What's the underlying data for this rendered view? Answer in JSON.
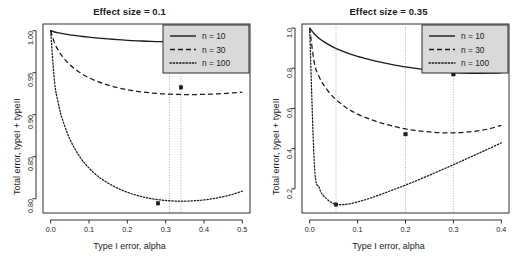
{
  "figure": {
    "width": 518,
    "height": 259,
    "background": "#ffffff",
    "line_color": "#1a1a1a",
    "legend_fill": "#d9d9d9",
    "guide_color": "#9a9a9a"
  },
  "panels": [
    {
      "id": "left",
      "title": "Effect size = 0.1",
      "xlabel": "Type I error, alpha",
      "ylabel": "Total error, typeI + typeII",
      "xticks": [
        "0.0",
        "0.1",
        "0.2",
        "0.3",
        "0.4",
        "0.5"
      ],
      "xtick_values": [
        0.0,
        0.1,
        0.2,
        0.3,
        0.4,
        0.5
      ],
      "yticks": [
        "1.00",
        "0.95",
        "0.90",
        "0.85",
        "0.80"
      ],
      "ytick_values": [
        1.0,
        0.95,
        0.9,
        0.85,
        0.8
      ],
      "xlim": [
        -0.02,
        0.52
      ],
      "ylim": [
        0.783,
        1.008
      ],
      "legend": {
        "position": "top-right",
        "entries": [
          {
            "label": "n = 10",
            "style": "solid"
          },
          {
            "label": "n = 30",
            "style": "dashed"
          },
          {
            "label": "n = 100",
            "style": "dotted"
          }
        ]
      },
      "minimum_markers": [
        {
          "series": "n = 30",
          "x": 0.34,
          "y": 0.9325
        },
        {
          "series": "n = 100",
          "x": 0.28,
          "y": 0.7945
        }
      ],
      "guide_lines_x": [
        0.31,
        0.34
      ]
    },
    {
      "id": "right",
      "title": "Effect size = 0.35",
      "xlabel": "Type I error, alpha",
      "ylabel": "Total error, typeI + typeII",
      "xticks": [
        "0.0",
        "0.1",
        "0.2",
        "0.3",
        "0.4"
      ],
      "xtick_values": [
        0.0,
        0.1,
        0.2,
        0.3,
        0.4
      ],
      "yticks": [
        "1.0",
        "0.8",
        "0.6",
        "0.4",
        "0.2"
      ],
      "ytick_values": [
        1.0,
        0.8,
        0.6,
        0.4,
        0.2
      ],
      "xlim": [
        -0.016,
        0.416
      ],
      "ylim": [
        0.08,
        1.02
      ],
      "legend": {
        "position": "top-right",
        "entries": [
          {
            "label": "n = 10",
            "style": "solid"
          },
          {
            "label": "n = 30",
            "style": "dashed"
          },
          {
            "label": "n = 100",
            "style": "dotted"
          }
        ]
      },
      "minimum_markers": [
        {
          "series": "n = 10",
          "x": 0.3,
          "y": 0.77
        },
        {
          "series": "n = 30",
          "x": 0.2,
          "y": 0.472
        },
        {
          "series": "n = 100",
          "x": 0.055,
          "y": 0.122
        }
      ],
      "guide_lines_x": [
        0.055,
        0.2,
        0.3
      ]
    }
  ],
  "chart_data": [
    {
      "type": "line",
      "panel": "left",
      "title": "Effect size = 0.1",
      "xlabel": "Type I error, alpha",
      "ylabel": "Total error, typeI + typeII",
      "xlim": [
        0.0,
        0.5
      ],
      "ylim": [
        0.78,
        1.0
      ],
      "grid": false,
      "legend_position": "top-right",
      "x": [
        0.0,
        0.01,
        0.02,
        0.03,
        0.05,
        0.075,
        0.1,
        0.125,
        0.15,
        0.175,
        0.2,
        0.225,
        0.25,
        0.275,
        0.3,
        0.325,
        0.35,
        0.375,
        0.4,
        0.425,
        0.45,
        0.475,
        0.5
      ],
      "series": [
        {
          "name": "n = 10",
          "style": "solid",
          "values": [
            1.0,
            0.9985,
            0.9975,
            0.9966,
            0.9951,
            0.9936,
            0.9923,
            0.9912,
            0.9902,
            0.9894,
            0.9886,
            0.988,
            0.9875,
            0.9871,
            0.9868,
            0.9866,
            0.9865,
            0.9865,
            0.9866,
            0.9868,
            0.9871,
            0.9875,
            0.988
          ]
        },
        {
          "name": "n = 30",
          "style": "dashed",
          "values": [
            1.0,
            0.9855,
            0.9765,
            0.9697,
            0.9596,
            0.9505,
            0.944,
            0.9391,
            0.9353,
            0.9322,
            0.9298,
            0.9279,
            0.9265,
            0.9254,
            0.9247,
            0.9242,
            0.924,
            0.924,
            0.9242,
            0.9246,
            0.9252,
            0.926,
            0.927
          ]
        },
        {
          "name": "n = 100",
          "style": "dotted",
          "values": [
            1.0,
            0.9395,
            0.9135,
            0.8955,
            0.871,
            0.8505,
            0.8365,
            0.8262,
            0.8185,
            0.8124,
            0.8077,
            0.804,
            0.8012,
            0.7992,
            0.7979,
            0.7972,
            0.7971,
            0.7976,
            0.7986,
            0.8002,
            0.8024,
            0.8053,
            0.809
          ]
        }
      ],
      "annotations": [
        {
          "type": "vline",
          "x": 0.31,
          "style": "dotted",
          "note": "minimum of n = 100 region"
        },
        {
          "type": "vline",
          "x": 0.34,
          "style": "dotted",
          "note": "minimum of n = 30"
        },
        {
          "type": "point",
          "x": 0.28,
          "y": 0.7945,
          "series": "n = 100"
        },
        {
          "type": "point",
          "x": 0.34,
          "y": 0.9325,
          "series": "n = 30"
        }
      ]
    },
    {
      "type": "line",
      "panel": "right",
      "title": "Effect size = 0.35",
      "xlabel": "Type I error, alpha",
      "ylabel": "Total error, typeI + typeII",
      "xlim": [
        0.0,
        0.4
      ],
      "ylim": [
        0.1,
        1.0
      ],
      "grid": false,
      "legend_position": "top-right",
      "x": [
        0.0,
        0.01,
        0.02,
        0.03,
        0.05,
        0.075,
        0.1,
        0.125,
        0.15,
        0.175,
        0.2,
        0.225,
        0.25,
        0.275,
        0.3,
        0.325,
        0.35,
        0.375,
        0.4
      ],
      "series": [
        {
          "name": "n = 10",
          "style": "solid",
          "values": [
            1.0,
            0.97,
            0.948,
            0.931,
            0.904,
            0.879,
            0.859,
            0.843,
            0.829,
            0.817,
            0.807,
            0.798,
            0.79,
            0.784,
            0.779,
            0.776,
            0.775,
            0.7755,
            0.777
          ]
        },
        {
          "name": "n = 30",
          "style": "dashed",
          "values": [
            1.0,
            0.823,
            0.757,
            0.714,
            0.655,
            0.606,
            0.572,
            0.547,
            0.527,
            0.511,
            0.498,
            0.489,
            0.483,
            0.479,
            0.479,
            0.482,
            0.488,
            0.499,
            0.516
          ]
        },
        {
          "name": "n = 100",
          "style": "dotted",
          "values": [
            1.0,
            0.315,
            0.206,
            0.163,
            0.127,
            0.123,
            0.135,
            0.153,
            0.174,
            0.196,
            0.219,
            0.243,
            0.268,
            0.294,
            0.32,
            0.347,
            0.374,
            0.401,
            0.429
          ]
        }
      ],
      "annotations": [
        {
          "type": "vline",
          "x": 0.055,
          "style": "dotted",
          "note": "minimum of n = 100"
        },
        {
          "type": "vline",
          "x": 0.2,
          "style": "dotted",
          "note": "minimum of n = 30"
        },
        {
          "type": "vline",
          "x": 0.3,
          "style": "dotted",
          "note": "minimum of n = 10"
        },
        {
          "type": "point",
          "x": 0.055,
          "y": 0.122,
          "series": "n = 100"
        },
        {
          "type": "point",
          "x": 0.2,
          "y": 0.472,
          "series": "n = 30"
        },
        {
          "type": "point",
          "x": 0.3,
          "y": 0.77,
          "series": "n = 10"
        }
      ]
    }
  ]
}
